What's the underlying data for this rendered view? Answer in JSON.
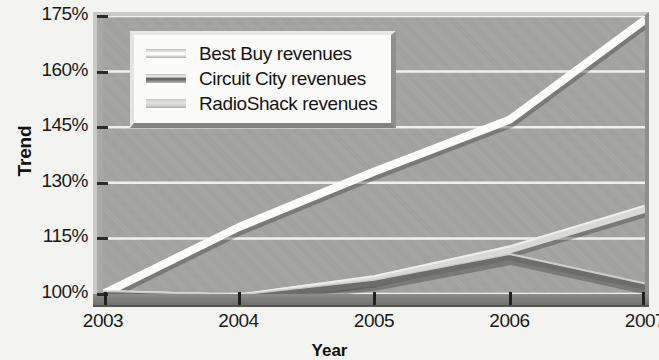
{
  "chart_data": {
    "type": "line",
    "title": "",
    "xlabel": "Year",
    "ylabel": "Trend",
    "x": [
      2003,
      2004,
      2005,
      2006,
      2007
    ],
    "xtick_labels": [
      "2003",
      "2004",
      "2005",
      "2006",
      "2007"
    ],
    "ytick_labels": [
      "100%",
      "115%",
      "130%",
      "145%",
      "160%",
      "175%"
    ],
    "ytick_values": [
      100,
      115,
      130,
      145,
      160,
      175
    ],
    "ylim": [
      100,
      175
    ],
    "xlim": [
      2003,
      2007
    ],
    "grid": true,
    "grid_color": "#f0f0ec",
    "legend_position": "top-left",
    "series": [
      {
        "name": "Best Buy revenues",
        "color": "#fbfbf7",
        "values": [
          100,
          118,
          133,
          147,
          174
        ]
      },
      {
        "name": "Circuit City revenues",
        "color": "#6d6d69",
        "values": [
          100,
          99,
          103,
          110,
          102
        ]
      },
      {
        "name": "RadioShack revenues",
        "color": "#d8d8d4",
        "values": [
          100,
          99,
          104,
          112,
          123
        ]
      }
    ]
  },
  "axes": {
    "y_title": "Trend",
    "x_title": "Year",
    "y_ticks": [
      {
        "label": "175%",
        "value": 175
      },
      {
        "label": "160%",
        "value": 160
      },
      {
        "label": "145%",
        "value": 145
      },
      {
        "label": "130%",
        "value": 130
      },
      {
        "label": "115%",
        "value": 115
      },
      {
        "label": "100%",
        "value": 100
      }
    ],
    "x_ticks": [
      {
        "label": "2003",
        "value": 2003
      },
      {
        "label": "2004",
        "value": 2004
      },
      {
        "label": "2005",
        "value": 2005
      },
      {
        "label": "2006",
        "value": 2006
      },
      {
        "label": "2007",
        "value": 2007
      }
    ]
  },
  "legend": {
    "entries": [
      {
        "label": "Best Buy revenues",
        "swatch": "sw-bestbuy"
      },
      {
        "label": "Circuit City revenues",
        "swatch": "sw-circuit"
      },
      {
        "label": "RadioShack revenues",
        "swatch": "sw-radio"
      }
    ]
  }
}
